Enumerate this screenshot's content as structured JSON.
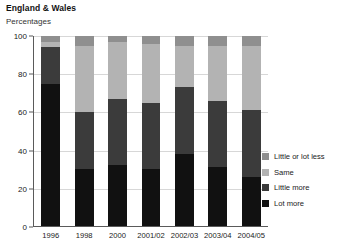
{
  "header": {
    "title": "England & Wales",
    "subtitle": "Percentages"
  },
  "chart_data": {
    "type": "bar",
    "stacked": true,
    "title": "England & Wales",
    "subtitle": "Percentages",
    "xlabel": "",
    "ylabel": "Percentages",
    "ylim": [
      0,
      100
    ],
    "yticks": [
      0,
      20,
      40,
      60,
      80,
      100
    ],
    "grid": true,
    "legend_position": "right",
    "categories": [
      "1996",
      "1998",
      "2000",
      "2001/02",
      "2002/03",
      "2003/04",
      "2004/05"
    ],
    "series": [
      {
        "name": "Lot more",
        "color": "#111111",
        "values": [
          75,
          30,
          32,
          30,
          38,
          31,
          26
        ]
      },
      {
        "name": "Little more",
        "color": "#3b3b3b",
        "values": [
          19,
          30,
          35,
          35,
          35,
          35,
          35
        ]
      },
      {
        "name": "Same",
        "color": "#b3b3b3",
        "values": [
          3,
          35,
          30,
          31,
          22,
          29,
          34
        ]
      },
      {
        "name": "Little or lot less",
        "color": "#8f8f8f",
        "values": [
          3,
          5,
          3,
          4,
          5,
          5,
          5
        ]
      }
    ],
    "legend_order_top_to_bottom": [
      "Little or lot less",
      "Same",
      "Little more",
      "Lot more"
    ]
  },
  "legend": {
    "items": [
      {
        "label": "Little or lot less",
        "color": "#8f8f8f"
      },
      {
        "label": "Same",
        "color": "#b3b3b3"
      },
      {
        "label": "Little more",
        "color": "#3b3b3b"
      },
      {
        "label": "Lot more",
        "color": "#111111"
      }
    ]
  }
}
